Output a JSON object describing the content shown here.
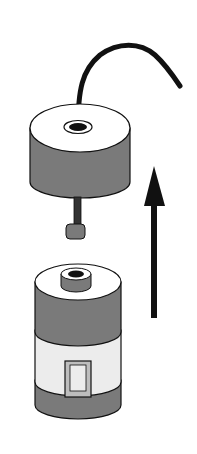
{
  "diagram": {
    "elements": [
      {
        "id": "cable",
        "name": "curved cable"
      },
      {
        "id": "cap",
        "name": "cylindrical cap with cable entry"
      },
      {
        "id": "stem",
        "name": "stem with small knob under cap"
      },
      {
        "id": "container",
        "name": "cylindrical container with top port and side window"
      },
      {
        "id": "arrow",
        "name": "upward direction arrow"
      }
    ],
    "colors": {
      "outline": "#111111",
      "dark_fill": "#7a7a7a",
      "light_fill": "#ececec",
      "white_fill": "#ffffff",
      "arrow": "#111111"
    }
  }
}
